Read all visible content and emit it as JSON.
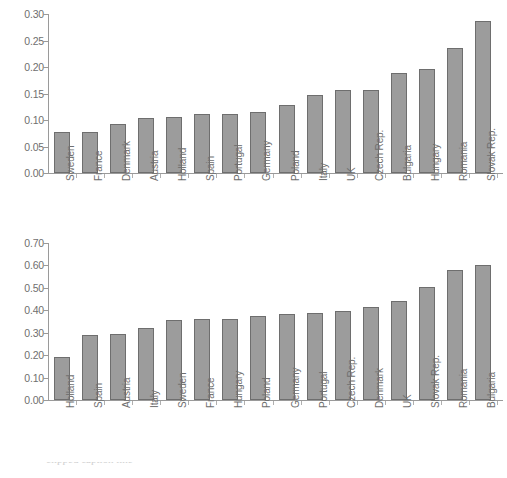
{
  "chart_data": [
    {
      "type": "bar",
      "id": "top-chart",
      "title": "",
      "xlabel": "",
      "ylabel": "",
      "ylim": [
        0.0,
        0.3
      ],
      "ytick_step": 0.05,
      "grid": false,
      "legend": "none",
      "bar_color": "#9c9c9c",
      "bar_border_color": "#6e6e6e",
      "ytick_labels": [
        "0.30",
        "0.25",
        "0.20",
        "0.15",
        "0.10",
        "0.05",
        "0.00"
      ],
      "ytick_values": [
        0.3,
        0.25,
        0.2,
        0.15,
        0.1,
        0.05,
        0.0
      ],
      "categories": [
        "Sweden",
        "France",
        "Denmark",
        "Austria",
        "Holland",
        "Spain",
        "Portugal",
        "Germany",
        "Poland",
        "Italy",
        "UK",
        "Czech Rep.",
        "Bulgaria",
        "Hungary",
        "Romania",
        "Slovak Rep."
      ],
      "values": [
        0.077,
        0.078,
        0.093,
        0.103,
        0.106,
        0.111,
        0.112,
        0.116,
        0.129,
        0.147,
        0.156,
        0.157,
        0.189,
        0.196,
        0.236,
        0.287
      ]
    },
    {
      "type": "bar",
      "id": "bottom-chart",
      "title": "",
      "xlabel": "",
      "ylabel": "",
      "ylim": [
        0.0,
        0.7
      ],
      "ytick_step": 0.1,
      "grid": false,
      "legend": "none",
      "bar_color": "#9c9c9c",
      "bar_border_color": "#6e6e6e",
      "ytick_labels": [
        "0.70",
        "0.60",
        "0.50",
        "0.40",
        "0.30",
        "0.20",
        "0.10",
        "0.00"
      ],
      "ytick_values": [
        0.7,
        0.6,
        0.5,
        0.4,
        0.3,
        0.2,
        0.1,
        0.0
      ],
      "categories": [
        "Holland",
        "Spain",
        "Austria",
        "Italy",
        "Sweden",
        "France",
        "Hungary",
        "Poland",
        "Germany",
        "Portugal",
        "Czech Rep.",
        "Denmark",
        "UK",
        "Slovak Rep.",
        "Romania",
        "Bulgaria"
      ],
      "values": [
        0.193,
        0.291,
        0.296,
        0.323,
        0.356,
        0.359,
        0.359,
        0.373,
        0.382,
        0.39,
        0.396,
        0.414,
        0.44,
        0.503,
        0.58,
        0.604
      ]
    }
  ],
  "caption": {
    "text": "clipped caption line"
  }
}
